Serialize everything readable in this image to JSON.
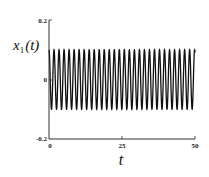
{
  "chart_data": {
    "type": "line",
    "title": "",
    "xlabel": "t",
    "ylabel": "x_1(t)",
    "ylabel_display": {
      "main": "x",
      "sub": "1",
      "arg": "(t)"
    },
    "xlim": [
      0,
      50
    ],
    "ylim": [
      -0.2,
      0.2
    ],
    "x_ticks": [
      0,
      25,
      50
    ],
    "x_tick_labels": [
      "0",
      "25",
      "50"
    ],
    "y_ticks": [
      -0.2,
      0,
      0.2
    ],
    "y_tick_labels": [
      "-0.2",
      "0",
      "0.2"
    ],
    "grid": false,
    "legend": null,
    "series": [
      {
        "name": "x_1(t)",
        "description": "sustained periodic oscillation with constant amplitude",
        "amplitude": 0.1,
        "offset": 0,
        "min": -0.1,
        "max": 0.1,
        "approx_peaks": 29,
        "approx_period": 1.72,
        "color": "#111111"
      }
    ]
  }
}
